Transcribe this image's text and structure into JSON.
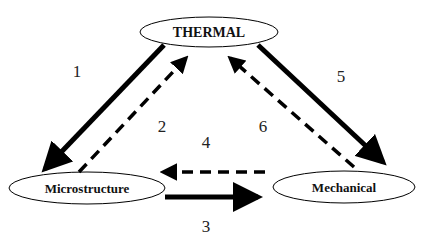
{
  "diagram": {
    "nodes": {
      "thermal": {
        "label": "THERMAL"
      },
      "microstructure": {
        "label": "Microstructure"
      },
      "mechanical": {
        "label": "Mechanical"
      }
    },
    "edges": [
      {
        "id": "1",
        "label": "1",
        "from": "THERMAL",
        "to": "Microstructure",
        "style": "solid"
      },
      {
        "id": "2",
        "label": "2",
        "from": "Microstructure",
        "to": "THERMAL",
        "style": "dashed"
      },
      {
        "id": "3",
        "label": "3",
        "from": "Microstructure",
        "to": "Mechanical",
        "style": "solid"
      },
      {
        "id": "4",
        "label": "4",
        "from": "Mechanical",
        "to": "Microstructure",
        "style": "dashed"
      },
      {
        "id": "5",
        "label": "5",
        "from": "THERMAL",
        "to": "Mechanical",
        "style": "solid"
      },
      {
        "id": "6",
        "label": "6",
        "from": "Mechanical",
        "to": "THERMAL",
        "style": "dashed"
      }
    ],
    "colors": {
      "stroke": "#000000",
      "background": "#ffffff"
    }
  }
}
